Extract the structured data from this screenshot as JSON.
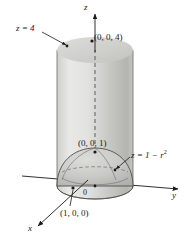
{
  "figure": {
    "background_color": "#ffffff",
    "ink_color": "#1a1a1a"
  },
  "axes": {
    "z": {
      "label": "z",
      "x": 84,
      "y": 3
    },
    "y": {
      "label": "y",
      "x": 172,
      "y": 191
    },
    "x": {
      "label": "x",
      "x": 28,
      "y": 224
    }
  },
  "labels": {
    "plane_top": "z = 4",
    "point_top": "(0, 0, 4)",
    "point_apex": "(0, 0, 1)",
    "surface_equation_prefix": "z = 1 − r",
    "surface_equation_exponent": "2",
    "point_radius": "(1, 0, 0)",
    "origin": "0"
  },
  "surfaces": {
    "cylinder": {
      "name": "cylinder",
      "fill_left": "#e4e4e2",
      "fill_right": "#b9b9b7",
      "stroke": "#5a5a58",
      "top_cap_fill": "#d2d2d0",
      "radius_px": 38,
      "top_y": 50,
      "bottom_y": 186
    },
    "paraboloid": {
      "name": "paraboloid-dome",
      "equation": "z = 1 - r^2",
      "fill": "#c9c9c6",
      "stroke": "#4e4e4c",
      "apex_y": 148,
      "base_y": 186,
      "radius_px": 38
    }
  },
  "markers": [
    {
      "name": "point-0-0-4",
      "x": 92,
      "y": 41
    },
    {
      "name": "point-z4-leader-dot",
      "x": 67,
      "y": 46
    },
    {
      "name": "point-0-0-1",
      "x": 97,
      "y": 153
    },
    {
      "name": "point-equation-leader-dot",
      "x": 115,
      "y": 170
    },
    {
      "name": "point-1-0-0",
      "x": 72,
      "y": 187
    }
  ],
  "colors": {
    "accent_light": "#e4e4e2",
    "accent_mid": "#c9c9c6",
    "accent_dark": "#b9b9b7",
    "outline": "#4e4e4c"
  }
}
